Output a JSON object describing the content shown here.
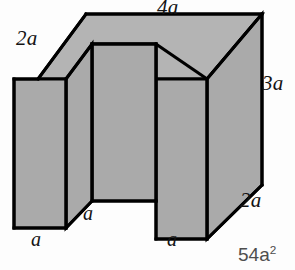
{
  "figure": {
    "name": "u-shaped-prism",
    "colors": {
      "face_fill": "#aaaaaa",
      "top_fill": "#b4b4b4",
      "outline": "#000000",
      "background": "#fdfdfd",
      "answer_text": "#4e4e4e",
      "label_text": "#141414"
    },
    "labels": [
      {
        "id": "top-depth",
        "text": "2a",
        "x": 16,
        "y": 28
      },
      {
        "id": "top-width",
        "text": "4a",
        "x": 157,
        "y": -2
      },
      {
        "id": "right-height",
        "text": "3a",
        "x": 262,
        "y": 73
      },
      {
        "id": "right-depth",
        "text": "2a",
        "x": 240,
        "y": 190
      },
      {
        "id": "notch-depth",
        "text": "a",
        "x": 83,
        "y": 203
      },
      {
        "id": "left-foot-width",
        "text": "a",
        "x": 31,
        "y": 228
      },
      {
        "id": "right-foot-width",
        "text": "a",
        "x": 167,
        "y": 228
      }
    ],
    "answer": {
      "base": "54a",
      "exponent": "2"
    }
  }
}
